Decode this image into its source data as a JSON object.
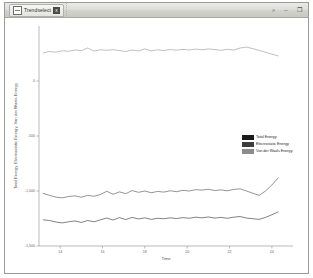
{
  "window": {
    "tab_title": "Trendselect",
    "tab_close_label": "x",
    "controls": {
      "search": "⌕",
      "minimize": "–",
      "maximize": "❐"
    }
  },
  "legend": {
    "items": [
      {
        "label": "Total Energy",
        "color": "#1a1a1a"
      },
      {
        "label": "Electrostatic Energy",
        "color": "#3d3d3d"
      },
      {
        "label": "Van der Waals Energy",
        "color": "#8c8c8c"
      }
    ]
  },
  "chart_data": {
    "type": "line",
    "title": "",
    "xlabel": "Time",
    "ylabel": "Total Energy, Electrostatic Energy, Van der Waals Energy",
    "xlim": [
      13,
      25
    ],
    "ylim": [
      -1500,
      500
    ],
    "grid": false,
    "legend_position": "right-middle",
    "xticks": [
      14,
      16,
      18,
      20,
      22,
      24
    ],
    "xtick_labels": [
      "14",
      "16",
      "18",
      "20",
      "22",
      "24"
    ],
    "yticks": [
      0,
      -500,
      -1000,
      -1500
    ],
    "ytick_labels": [
      "0",
      "-500",
      "-1,000",
      "-1,500"
    ],
    "x": [
      13.2,
      13.5,
      13.8,
      14.1,
      14.4,
      14.7,
      15.0,
      15.3,
      15.6,
      15.9,
      16.2,
      16.5,
      16.8,
      17.1,
      17.4,
      17.7,
      18.0,
      18.3,
      18.6,
      18.9,
      19.2,
      19.5,
      19.8,
      20.1,
      20.4,
      20.7,
      21.0,
      21.3,
      21.6,
      21.9,
      22.2,
      22.5,
      22.8,
      23.1,
      23.4,
      23.7,
      24.0,
      24.3
    ],
    "series": [
      {
        "name": "Van der Waals Energy",
        "color": "#8c8c8c",
        "values": [
          255,
          268,
          262,
          275,
          270,
          282,
          276,
          300,
          272,
          284,
          279,
          285,
          276,
          268,
          282,
          273,
          292,
          274,
          283,
          277,
          286,
          280,
          288,
          282,
          290,
          284,
          291,
          286,
          279,
          288,
          281,
          300,
          308,
          295,
          278,
          262,
          244,
          228
        ]
      },
      {
        "name": "Electrostatic Energy",
        "color": "#3d3d3d",
        "values": [
          -1022,
          -1040,
          -1056,
          -1062,
          -1050,
          -1044,
          -1056,
          -1040,
          -1048,
          -1032,
          -1002,
          -1030,
          -1008,
          -1024,
          -996,
          -1012,
          -1000,
          -1016,
          -1004,
          -1010,
          -998,
          -1006,
          -994,
          -1000,
          -988,
          -992,
          -984,
          -996,
          -990,
          -998,
          -986,
          -980,
          -1000,
          -1020,
          -1040,
          -1000,
          -946,
          -880
        ]
      },
      {
        "name": "Total Energy",
        "color": "#1a1a1a",
        "values": [
          -1262,
          -1268,
          -1282,
          -1290,
          -1280,
          -1272,
          -1286,
          -1268,
          -1280,
          -1262,
          -1246,
          -1264,
          -1242,
          -1260,
          -1240,
          -1254,
          -1244,
          -1258,
          -1248,
          -1252,
          -1244,
          -1250,
          -1242,
          -1248,
          -1238,
          -1244,
          -1236,
          -1246,
          -1240,
          -1248,
          -1238,
          -1232,
          -1246,
          -1252,
          -1258,
          -1240,
          -1216,
          -1190
        ]
      }
    ]
  }
}
